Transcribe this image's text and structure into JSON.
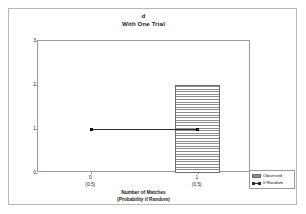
{
  "chart_data": {
    "type": "bar",
    "title": "d",
    "subtitle": "With One Trial",
    "xlabel": "Number of Matches",
    "xlabel_line2": "(Probability if Random)",
    "ylabel": "Number of Principals",
    "categories": [
      "0",
      "1"
    ],
    "category_sublabels": [
      "(0.5)",
      "(0.5)"
    ],
    "ylim": [
      0,
      3
    ],
    "yticks": [
      "0",
      "1",
      "2",
      "3"
    ],
    "grid": false,
    "legend_position": "bottom-right-outside",
    "series": [
      {
        "name": "Observed",
        "type": "bar",
        "values": [
          0,
          2
        ],
        "fill": "horizontal-hatch",
        "edge_color": "#6e6e6e"
      },
      {
        "name": "If Random",
        "type": "line",
        "values": [
          1,
          1
        ],
        "marker": "square",
        "color": "#2b2b2b"
      }
    ]
  },
  "legend": {
    "items": [
      {
        "label": "Observed"
      },
      {
        "label": "If Random"
      }
    ]
  },
  "colors": {
    "axis": "#9a9a9a",
    "frame": "#b9b9b9",
    "bar_edge": "#6e6e6e",
    "bar_hatch": "#8d8d8d",
    "series_line": "#2b2b2b",
    "text": "#1a1a1a",
    "background": "#ffffff"
  }
}
